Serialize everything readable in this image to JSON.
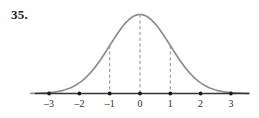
{
  "figure": {
    "problem_number": "35.",
    "width": 259,
    "height": 118,
    "background_color": "#ffffff",
    "curve_color": "#8c8c8c",
    "axis_color": "#333333",
    "dash_color": "#8c8c8c",
    "tick_dot_color": "#1a1a1a",
    "label_color": "#2b2b2b"
  },
  "chart_data": {
    "type": "line",
    "title": "",
    "subtitle": "",
    "xlabel": "",
    "ylabel": "",
    "grid": false,
    "legend": null,
    "curve_name": "standard-normal-density",
    "xlim": [
      -3.6,
      3.6
    ],
    "ylim": [
      0,
      0.4
    ],
    "x_ticks": [
      -3,
      -2,
      -1,
      0,
      1,
      2,
      3
    ],
    "x_tick_labels": [
      "–3",
      "–2",
      "–1",
      "0",
      "1",
      "2",
      "3"
    ],
    "y_ticks": [],
    "y_tick_labels": [],
    "annotations": [
      {
        "name": "dashed-line-minus-one",
        "x": -1,
        "style": "dashed-vertical"
      },
      {
        "name": "dashed-line-zero",
        "x": 0,
        "style": "dashed-vertical"
      },
      {
        "name": "dashed-line-plus-one",
        "x": 1,
        "style": "dashed-vertical"
      }
    ],
    "x": [
      -3.6,
      -3.4,
      -3.2,
      -3.0,
      -2.8,
      -2.6,
      -2.4,
      -2.2,
      -2.0,
      -1.8,
      -1.6,
      -1.4,
      -1.2,
      -1.0,
      -0.8,
      -0.6,
      -0.4,
      -0.2,
      0.0,
      0.2,
      0.4,
      0.6,
      0.8,
      1.0,
      1.2,
      1.4,
      1.6,
      1.8,
      2.0,
      2.2,
      2.4,
      2.6,
      2.8,
      3.0,
      3.2,
      3.4,
      3.6
    ],
    "y": [
      0.0006,
      0.0012,
      0.0024,
      0.0044,
      0.0079,
      0.0136,
      0.0224,
      0.0355,
      0.054,
      0.079,
      0.1109,
      0.1497,
      0.1942,
      0.242,
      0.2897,
      0.3332,
      0.3683,
      0.391,
      0.3989,
      0.391,
      0.3683,
      0.3332,
      0.2897,
      0.242,
      0.1942,
      0.1497,
      0.1109,
      0.079,
      0.054,
      0.0355,
      0.0224,
      0.0136,
      0.0079,
      0.0044,
      0.0024,
      0.0012,
      0.0006
    ]
  }
}
